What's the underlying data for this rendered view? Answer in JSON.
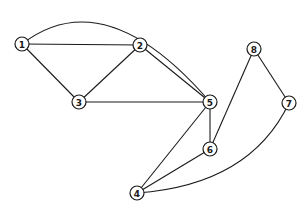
{
  "graph": {
    "nodes": [
      {
        "id": "1",
        "label": "1",
        "x": 22,
        "y": 44
      },
      {
        "id": "2",
        "label": "2",
        "x": 140,
        "y": 45
      },
      {
        "id": "3",
        "label": "3",
        "x": 79,
        "y": 102
      },
      {
        "id": "4",
        "label": "4",
        "x": 137,
        "y": 193
      },
      {
        "id": "5",
        "label": "5",
        "x": 210,
        "y": 102
      },
      {
        "id": "6",
        "label": "6",
        "x": 210,
        "y": 149
      },
      {
        "id": "7",
        "label": "7",
        "x": 289,
        "y": 103
      },
      {
        "id": "8",
        "label": "8",
        "x": 254,
        "y": 49
      }
    ],
    "edges": [
      {
        "from": "1",
        "to": "2",
        "type": "line"
      },
      {
        "from": "1",
        "to": "3",
        "type": "line"
      },
      {
        "from": "1",
        "to": "5",
        "type": "arc",
        "ctrl": [
          105,
          -20
        ]
      },
      {
        "from": "2",
        "to": "3",
        "type": "line"
      },
      {
        "from": "2",
        "to": "5",
        "type": "line"
      },
      {
        "from": "3",
        "to": "5",
        "type": "line"
      },
      {
        "from": "5",
        "to": "6",
        "type": "line"
      },
      {
        "from": "5",
        "to": "4",
        "type": "line"
      },
      {
        "from": "6",
        "to": "4",
        "type": "line"
      },
      {
        "from": "6",
        "to": "8",
        "type": "line"
      },
      {
        "from": "8",
        "to": "7",
        "type": "line"
      },
      {
        "from": "7",
        "to": "4",
        "type": "arc",
        "ctrl": [
          250,
          185
        ]
      }
    ],
    "node_radius": 7,
    "stroke_color": "#1a1a1a"
  }
}
